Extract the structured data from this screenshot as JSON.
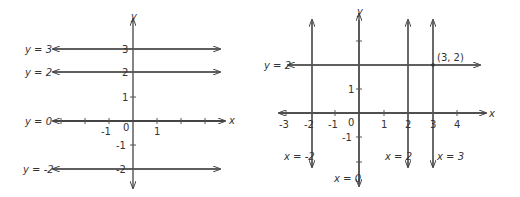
{
  "left_graph": {
    "axis_labels": {
      "x": "x",
      "y": "y"
    },
    "x_ticks": [
      "-1",
      "0",
      "1"
    ],
    "y_ticks": [
      "3",
      "2",
      "1",
      "-1",
      "-2"
    ],
    "lines": [
      {
        "label": "y = 3",
        "value": 3
      },
      {
        "label": "y = 2",
        "value": 2
      },
      {
        "label": "y = 0",
        "value": 0
      },
      {
        "label": "y = -2",
        "value": -2
      }
    ]
  },
  "right_graph": {
    "axis_labels": {
      "x": "x",
      "y": "y"
    },
    "x_ticks": [
      "-3",
      "-2",
      "-1",
      "0",
      "1",
      "2",
      "3",
      "4"
    ],
    "y_ticks": [
      "1",
      "-1"
    ],
    "horizontal_lines": [
      {
        "label": "y = 2",
        "value": 2
      }
    ],
    "vertical_lines": [
      {
        "label": "x = -2",
        "value": -2
      },
      {
        "label": "x = 0",
        "value": 0
      },
      {
        "label": "x = 2",
        "value": 2
      },
      {
        "label": "x = 3",
        "value": 3
      }
    ],
    "point": {
      "label": "(3, 2)",
      "x": 3,
      "y": 2
    }
  }
}
